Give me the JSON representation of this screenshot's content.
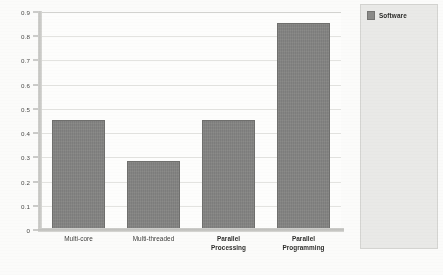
{
  "chart_data": {
    "type": "bar",
    "title": "",
    "xlabel": "",
    "ylabel": "",
    "categories": [
      "Multi-core",
      "Multi-threaded",
      "Parallel Processing",
      "Parallel Programming"
    ],
    "category_lines": [
      [
        "Multi-core"
      ],
      [
        "Multi-threaded"
      ],
      [
        "Parallel",
        "Processing"
      ],
      [
        "Parallel",
        "Programming"
      ]
    ],
    "category_bold": [
      false,
      false,
      true,
      true
    ],
    "values": [
      0.455,
      0.285,
      0.455,
      0.855
    ],
    "series": [
      {
        "name": "Software",
        "values": [
          0.455,
          0.285,
          0.455,
          0.855
        ]
      }
    ],
    "ylim": [
      0,
      0.9
    ],
    "ytick_labels": [
      "0",
      "0.1",
      "0.2",
      "0.3",
      "0.4",
      "0.5",
      "0.6",
      "0.7",
      "0.8",
      "0.9"
    ],
    "ytick_values": [
      0,
      0.1,
      0.2,
      0.3,
      0.4,
      0.5,
      0.6,
      0.7,
      0.8,
      0.9
    ],
    "grid": true,
    "legend_position": "right",
    "legend_entries": [
      "Software"
    ],
    "bar_color": "#828280",
    "bar_border_color": "#6f6f6d",
    "gridline_color": "#e3e3e0",
    "axis_color": "#bfbfbc",
    "plot_background": "#fdfdfc",
    "legend_background": "#e9e9e7",
    "legend_border_color": "#d4d4d1"
  },
  "legend": {
    "swatch_name": "software-series-swatch",
    "label": "Software"
  }
}
